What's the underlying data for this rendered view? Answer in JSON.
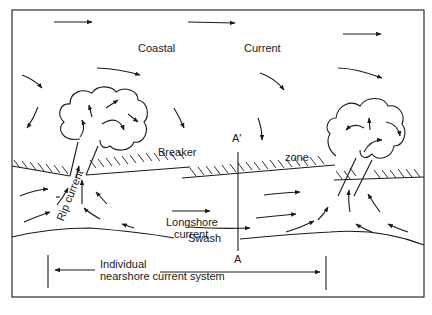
{
  "figure": {
    "type": "nearshore current system diagram",
    "labels": {
      "coastal": "Coastal",
      "current": "Current",
      "breaker": "Breaker",
      "zone": "zone",
      "rip_current": "Rip current",
      "longshore_line1": "Longshore",
      "longshore_line2": "current",
      "swash": "Swash",
      "section_top": "A′",
      "section_bottom": "A",
      "system_line1": "Individual",
      "system_line2": "nearshore current system"
    },
    "colors": {
      "ink": "#1a1a1a",
      "background": "#ffffff"
    }
  }
}
